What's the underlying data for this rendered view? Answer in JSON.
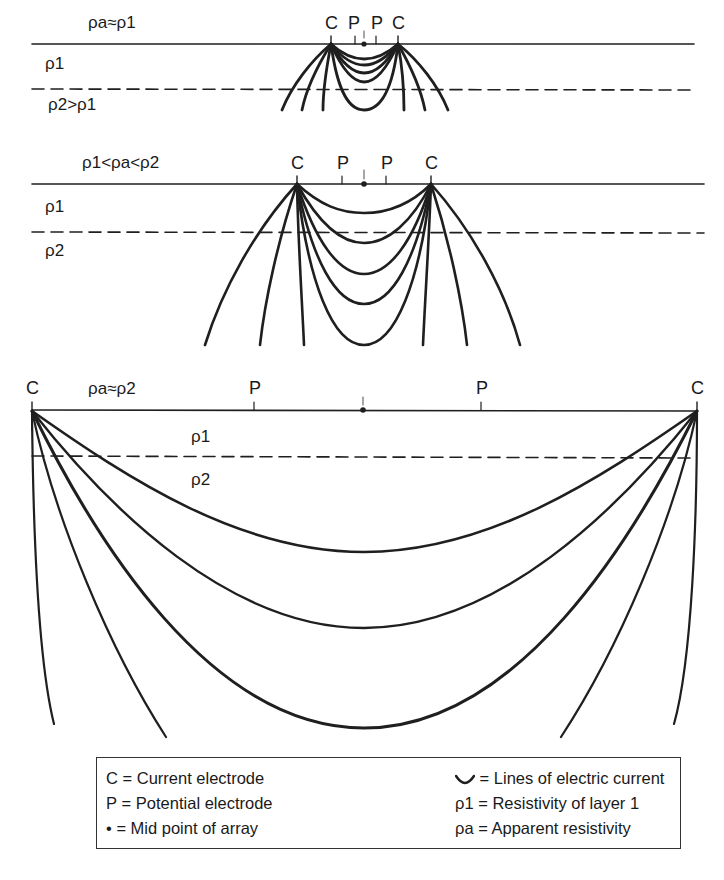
{
  "diagram": {
    "panels": [
      {
        "id": "small-spacing",
        "resistivity_label": "ρa≈ρ1",
        "layer1_label": "ρ1",
        "layer2_label": "ρ2>ρ1",
        "electrode_labels": [
          "C",
          "P",
          "P",
          "C"
        ],
        "surface_y": 44,
        "interface_y": 89,
        "current_x": [
          331,
          398
        ],
        "potential_x": [
          355,
          376
        ],
        "midpoint_x": 364
      },
      {
        "id": "medium-spacing",
        "resistivity_label": "ρ1<ρa<ρ2",
        "layer1_label": "ρ1",
        "layer2_label": "ρ2",
        "electrode_labels": [
          "C",
          "P",
          "P",
          "C"
        ],
        "surface_y": 184,
        "interface_y": 232,
        "current_x": [
          297,
          431
        ],
        "potential_x": [
          342,
          386
        ],
        "midpoint_x": 364
      },
      {
        "id": "large-spacing",
        "resistivity_label": "ρa≈ρ2",
        "layer1_label": "ρ1",
        "layer2_label": "ρ2",
        "electrode_labels": [
          "C",
          "P",
          "P",
          "C"
        ],
        "surface_y": 410,
        "interface_y": 457,
        "current_x": [
          32,
          697
        ],
        "potential_x": [
          254,
          481
        ],
        "midpoint_x": 363
      }
    ]
  },
  "legend": {
    "items": [
      {
        "symbol": "C",
        "text": "= Current electrode"
      },
      {
        "symbol": "P",
        "text": "= Potential electrode"
      },
      {
        "symbol": "•",
        "text": "= Mid point of array"
      },
      {
        "symbol": "curve",
        "text": "= Lines of electric current"
      },
      {
        "symbol": "ρ1",
        "text": "= Resistivity of layer 1"
      },
      {
        "symbol": "ρa",
        "text": "= Apparent resistivity"
      }
    ]
  }
}
